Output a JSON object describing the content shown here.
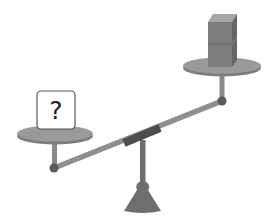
{
  "diagram": {
    "type": "balance-scale",
    "left_pan": {
      "object": "unknown-box",
      "label": "?",
      "position": "low"
    },
    "right_pan": {
      "object": "stacked-cubes",
      "count": 2,
      "position": "high"
    },
    "colors": {
      "plate": "#9a9a9a",
      "plate_edge": "#7d7d7d",
      "beam": "#8f8f8f",
      "sleeve": "#4d4d4d",
      "joint": "#5a5a5a",
      "stand": "#6e6e6e",
      "cube_front": "#7e7e7e",
      "cube_side": "#666666",
      "cube_top": "#a5a5a5",
      "box_fill": "#ffffff",
      "box_stroke": "#555555"
    }
  }
}
